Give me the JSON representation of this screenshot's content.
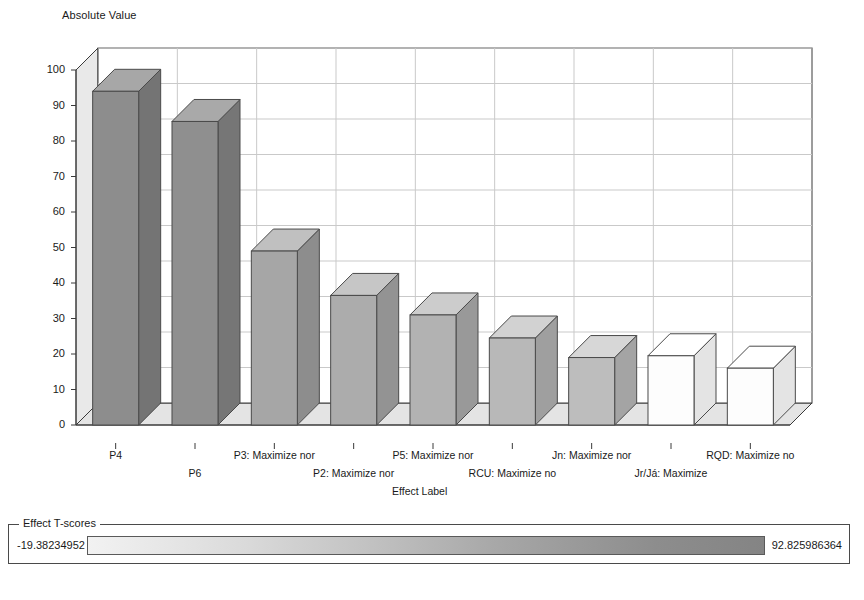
{
  "chart_data": {
    "type": "bar",
    "title": "",
    "ylabel": "Absolute Value",
    "xlabel": "Effect Label",
    "ylim": [
      0,
      100
    ],
    "yticks": [
      "0",
      "10",
      "20",
      "30",
      "40",
      "50",
      "60",
      "70",
      "80",
      "90",
      "100"
    ],
    "grid": true,
    "legend_position": "bottom",
    "categories": [
      "P4",
      "P6",
      "P3: Maximize nor",
      "P2: Maximize nor",
      "P5: Maximize nor",
      "RCU: Maximize no",
      "Jn: Maximize nor",
      "Jr/Já: Maximize",
      "RQD: Maximize no"
    ],
    "values": [
      94,
      85.5,
      49,
      36.5,
      31,
      24.5,
      19,
      19.5,
      16
    ],
    "bar_colors": [
      "#8d8d8d",
      "#8f8f8f",
      "#a6a6a6",
      "#acacac",
      "#b2b2b2",
      "#b8b8b8",
      "#bdbdbd",
      "#fdfdfd",
      "#fdfdfd"
    ],
    "series": [
      {
        "name": "Absolute Value",
        "values": [
          94,
          85.5,
          49,
          36.5,
          31,
          24.5,
          19,
          19.5,
          16
        ]
      }
    ]
  },
  "y_axis": {
    "title": "Absolute Value",
    "ticks": [
      "100",
      "90",
      "80",
      "70",
      "60",
      "50",
      "40",
      "30",
      "20",
      "10",
      "0"
    ]
  },
  "x_axis": {
    "title": "Effect Label",
    "ticks": [
      "P4",
      "P6",
      "P3: Maximize nor",
      "P2: Maximize nor",
      "P5: Maximize nor",
      "RCU: Maximize no",
      "Jn: Maximize nor",
      "Jr/Já: Maximize",
      "RQD: Maximize no"
    ]
  },
  "legend": {
    "title": "Effect T-scores",
    "min_label": "-19.38234952",
    "max_label": "92.825986364",
    "gradient_from": "#f2f2f2",
    "gradient_to": "#848484"
  },
  "colors": {
    "axis": "#3a3a3a",
    "grid": "#c9c9c9",
    "wall": "#e9e9e9",
    "floor": "#e4e4e4",
    "text": "#1a1a1a"
  }
}
